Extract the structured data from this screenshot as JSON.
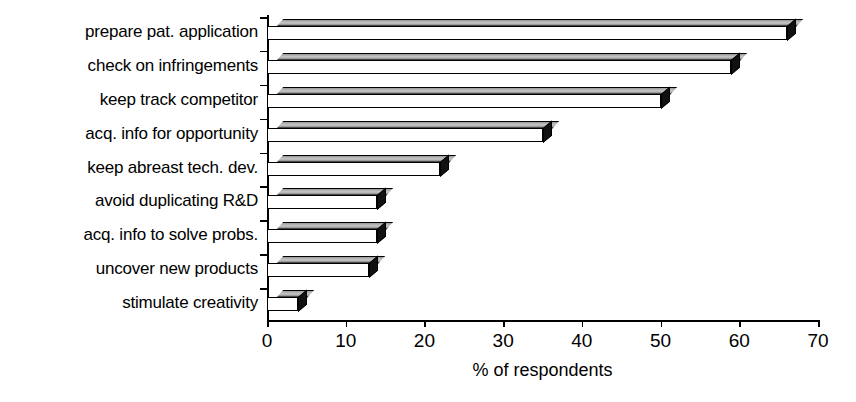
{
  "chart_data": {
    "type": "bar",
    "orientation": "horizontal",
    "style": "3d-isometric-grayscale",
    "title": "",
    "subtitle": "",
    "xlabel": "% of respondents",
    "ylabel": "",
    "xlim": [
      0,
      70
    ],
    "xticks": [
      0,
      10,
      20,
      30,
      40,
      50,
      60,
      70
    ],
    "xtick_labels": [
      "0",
      "10",
      "20",
      "30",
      "40",
      "50",
      "60",
      "70"
    ],
    "grid": false,
    "legend": false,
    "legend_position": "none",
    "categories": [
      "prepare pat. application",
      "check on infringements",
      "keep track competitor",
      "acq. info for opportunity",
      "keep abreast tech. dev.",
      "avoid duplicating R&D",
      "acq. info to solve probs.",
      "uncover new products",
      "stimulate creativity"
    ],
    "values": [
      66,
      59,
      50,
      35,
      22,
      14,
      14,
      13,
      4
    ],
    "annotations": []
  },
  "colors": {
    "bar_front": "#ffffff",
    "bar_top": "#c9c9c9",
    "bar_cap": "#111111",
    "outline": "#000000",
    "background": "#ffffff",
    "text": "#000000"
  }
}
